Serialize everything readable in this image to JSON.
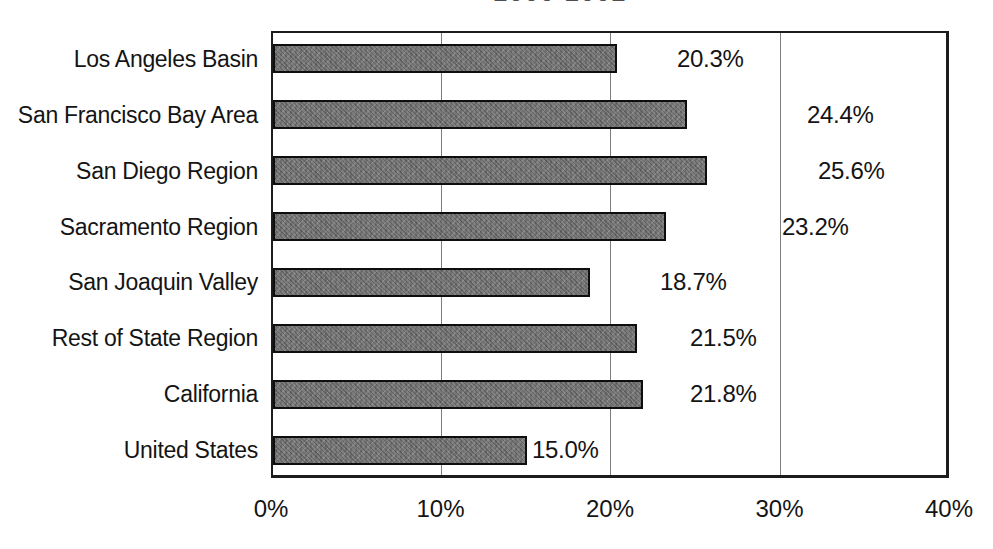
{
  "title": {
    "visible_fragment": "2000-2002"
  },
  "chart_data": {
    "type": "bar",
    "orientation": "horizontal",
    "title": "2000-2002",
    "categories": [
      "Los Angeles Basin",
      "San Francisco Bay Area",
      "San Diego Region",
      "Sacramento Region",
      "San Joaquin Valley",
      "Rest of State Region",
      "California",
      "United States"
    ],
    "values": [
      20.3,
      24.4,
      25.6,
      23.2,
      18.7,
      21.5,
      21.8,
      15.0
    ],
    "data_labels": [
      "20.3%",
      "24.4%",
      "25.6%",
      "23.2%",
      "18.7%",
      "21.5%",
      "21.8%",
      "15.0%"
    ],
    "xlabel": "",
    "ylabel": "",
    "xlim": [
      0,
      40
    ],
    "x_tick_labels": [
      "0%",
      "10%",
      "20%",
      "30%",
      "40%"
    ],
    "gridlines": "vertical major gridlines at 10%, 20%, 30%",
    "legend": "none",
    "bar_fill_color": "#7c7c7c",
    "bar_border_color": "#0e0e0e",
    "plot_border_color": "#1c1c1c",
    "background_color": "#ffffff"
  }
}
